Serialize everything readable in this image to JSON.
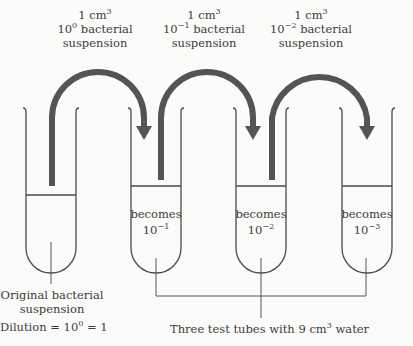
{
  "transfers": [
    {
      "volume": "1 cm",
      "volume_exp": "3",
      "base": "10",
      "exp": "0",
      "text": "bacterial",
      "line3": "suspension"
    },
    {
      "volume": "1 cm",
      "volume_exp": "3",
      "base": "10",
      "exp": "−1",
      "text": "bacterial",
      "line3": "suspension"
    },
    {
      "volume": "1 cm",
      "volume_exp": "3",
      "base": "10",
      "exp": "−2",
      "text": "bacterial",
      "line3": "suspension"
    }
  ],
  "tubes": [
    {
      "label": "",
      "exp": ""
    },
    {
      "label": "becomes",
      "base": "10",
      "exp": "−1"
    },
    {
      "label": "becomes",
      "base": "10",
      "exp": "−2"
    },
    {
      "label": "becomes",
      "base": "10",
      "exp": "−3"
    }
  ],
  "original": {
    "line1": "Original bacterial",
    "line2": "suspension",
    "dilution_prefix": "Dilution = 10",
    "dilution_exp": "0",
    "dilution_suffix": " = 1"
  },
  "water_note": {
    "prefix": "Three test tubes with 9 cm",
    "exp": "3",
    "suffix": " water"
  },
  "colors": {
    "arrow": "#545454",
    "tube": "#4a4a4a",
    "background": "#fbfbfa"
  }
}
